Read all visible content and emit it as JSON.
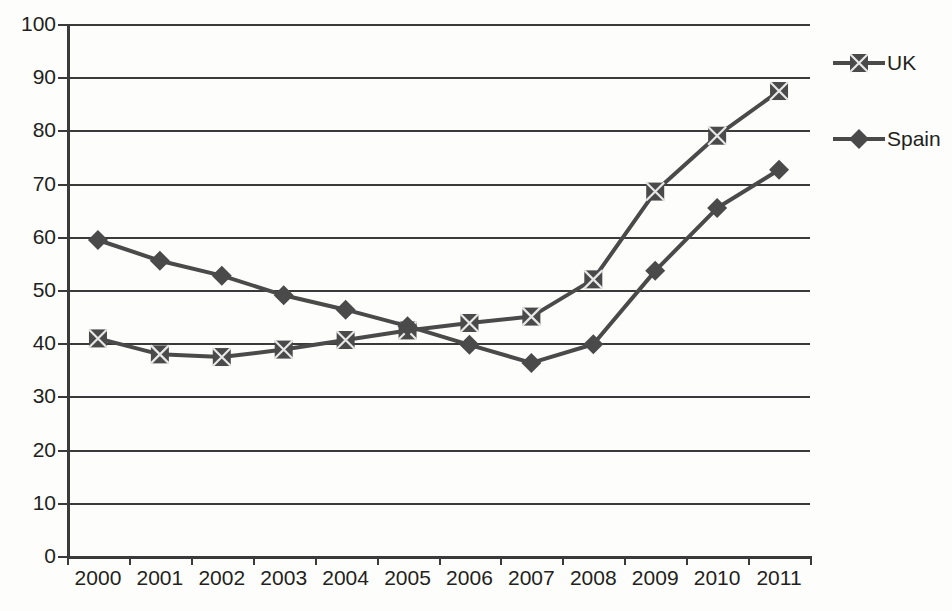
{
  "chart_data": {
    "type": "line",
    "title": "",
    "subtitle": "",
    "xlabel": "",
    "ylabel": "",
    "x": [
      "2000",
      "2001",
      "2002",
      "2003",
      "2004",
      "2005",
      "2006",
      "2007",
      "2008",
      "2009",
      "2010",
      "2011"
    ],
    "categories": [
      "2000",
      "2001",
      "2002",
      "2003",
      "2004",
      "2005",
      "2006",
      "2007",
      "2008",
      "2009",
      "2010",
      "2011"
    ],
    "series": [
      {
        "name": "UK",
        "marker": "square-x",
        "color": "#4a4a4a",
        "values": [
          40.9,
          37.9,
          37.4,
          38.8,
          40.6,
          42.4,
          43.8,
          45.0,
          52.0,
          68.5,
          79.0,
          87.4
        ]
      },
      {
        "name": "Spain",
        "marker": "diamond",
        "color": "#4a4a4a",
        "values": [
          59.4,
          55.5,
          52.7,
          49.0,
          46.3,
          43.2,
          39.7,
          36.3,
          39.8,
          53.6,
          65.4,
          72.6
        ]
      }
    ],
    "ylim": [
      0,
      100
    ],
    "y_ticks": [
      0,
      10,
      20,
      30,
      40,
      50,
      60,
      70,
      80,
      90,
      100
    ],
    "y_tick_labels": [
      "0",
      "10",
      "20",
      "30",
      "40",
      "50",
      "60",
      "70",
      "80",
      "90",
      "100"
    ],
    "grid": true,
    "grid_axis": "y",
    "legend_position": "right",
    "legend_entries": [
      "UK",
      "Spain"
    ],
    "background_color": "#fdfdfc",
    "axis_color": "#3a3a3a",
    "text_color": "#231f20"
  },
  "legend": {
    "items": [
      {
        "label": "UK"
      },
      {
        "label": "Spain"
      }
    ]
  },
  "axes": {
    "y_labels": [
      "100",
      "90",
      "80",
      "70",
      "60",
      "50",
      "40",
      "30",
      "20",
      "10",
      "0"
    ],
    "x_labels": [
      "2000",
      "2001",
      "2002",
      "2003",
      "2004",
      "2005",
      "2006",
      "2007",
      "2008",
      "2009",
      "2010",
      "2011"
    ]
  }
}
